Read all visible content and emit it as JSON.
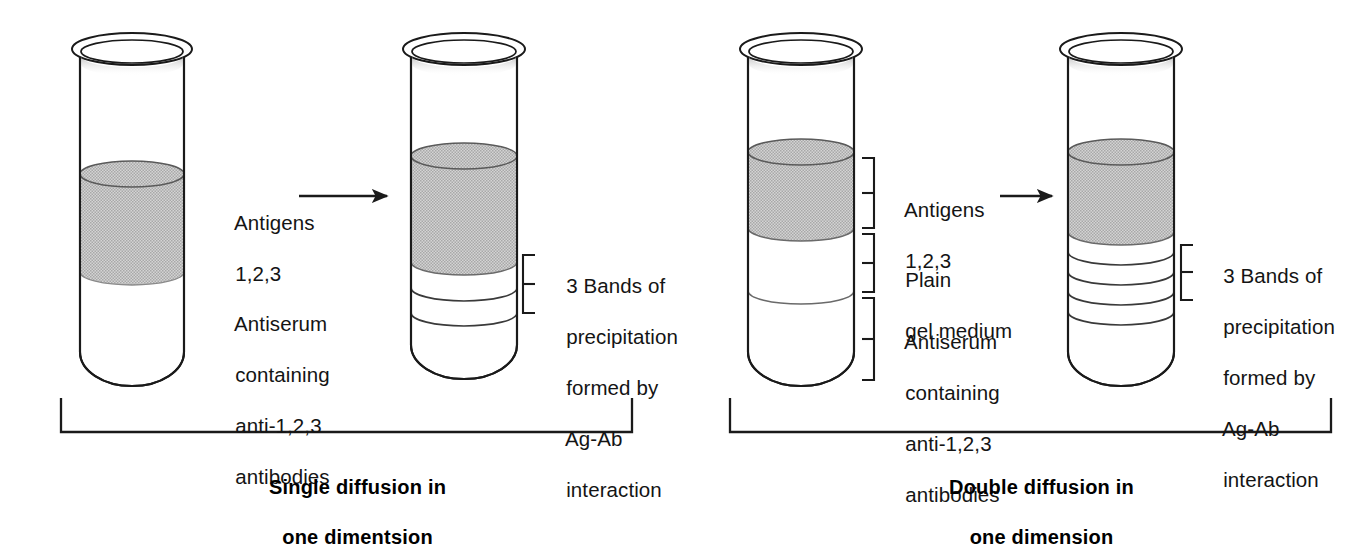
{
  "figure": {
    "title_semantic": "immunodiffusion-one-dimension-comparison",
    "background_color": "#ffffff",
    "ink_color": "#1a1a1a",
    "gel_gray": "#c2c2c2",
    "gel_gray_dark": "#b4b4b4"
  },
  "panels": [
    {
      "id": "single-diffusion",
      "caption_line1": "Single diffusion in",
      "caption_line2": "one dimentsion",
      "tubes": [
        {
          "id": "single-before",
          "role": "before-reaction",
          "layers": [
            {
              "name": "antigens",
              "fill": "gray"
            },
            {
              "name": "antiserum",
              "fill": "clear"
            }
          ],
          "bands": 0
        },
        {
          "id": "single-after",
          "role": "after-reaction",
          "layers": [
            {
              "name": "antigens",
              "fill": "gray"
            },
            {
              "name": "antiserum",
              "fill": "clear"
            }
          ],
          "bands": 3
        }
      ],
      "labels": [
        {
          "id": "antigens",
          "lines": [
            "Antigens",
            "1,2,3"
          ]
        },
        {
          "id": "antiserum",
          "lines": [
            "Antiserum",
            "containing",
            "anti-1,2,3",
            "antibodies"
          ]
        },
        {
          "id": "bands",
          "lines": [
            "3 Bands of",
            "precipitation",
            "formed by",
            "Ag-Ab",
            "interaction"
          ]
        }
      ]
    },
    {
      "id": "double-diffusion",
      "caption_line1": "Double diffusion in",
      "caption_line2": "one dimension",
      "tubes": [
        {
          "id": "double-before",
          "role": "before-reaction",
          "layers": [
            {
              "name": "antigens",
              "fill": "gray"
            },
            {
              "name": "plain-gel",
              "fill": "clear"
            },
            {
              "name": "antiserum",
              "fill": "clear"
            }
          ],
          "bands": 0
        },
        {
          "id": "double-after",
          "role": "after-reaction",
          "layers": [
            {
              "name": "antigens",
              "fill": "gray"
            },
            {
              "name": "antiserum",
              "fill": "clear"
            }
          ],
          "bands": 3
        }
      ],
      "labels": [
        {
          "id": "antigens",
          "lines": [
            "Antigens",
            "1,2,3"
          ]
        },
        {
          "id": "plain-gel",
          "lines": [
            "Plain",
            "gel medium"
          ]
        },
        {
          "id": "antiserum",
          "lines": [
            "Antiserum",
            "containing",
            "anti-1,2,3",
            "antibodies"
          ]
        },
        {
          "id": "bands",
          "lines": [
            "3 Bands of",
            "precipitation",
            "formed by",
            "Ag-Ab",
            "interaction"
          ]
        }
      ]
    }
  ],
  "text": {
    "left": {
      "antigens_l1": "Antigens",
      "antigens_l2": "1,2,3",
      "antiserum_l1": "Antiserum",
      "antiserum_l2": "containing",
      "antiserum_l3": "anti-1,2,3",
      "antiserum_l4": "antibodies",
      "bands_l1": "3 Bands of",
      "bands_l2": "precipitation",
      "bands_l3": "formed by",
      "bands_l4": "Ag-Ab",
      "bands_l5": "interaction",
      "caption_l1": "Single diffusion in",
      "caption_l2": "one dimentsion"
    },
    "right": {
      "antigens_l1": "Antigens",
      "antigens_l2": "1,2,3",
      "plain_l1": "Plain",
      "plain_l2": "gel medium",
      "antiserum_l1": "Antiserum",
      "antiserum_l2": "containing",
      "antiserum_l3": "anti-1,2,3",
      "antiserum_l4": "antibodies",
      "bands_l1": "3 Bands of",
      "bands_l2": "precipitation",
      "bands_l3": "formed by",
      "bands_l4": "Ag-Ab",
      "bands_l5": "interaction",
      "caption_l1": "Double diffusion in",
      "caption_l2": "one dimension"
    }
  },
  "icons": {
    "arrow": "rightwards-arrow-icon",
    "bracket": "curly-bracket-icon",
    "group_bracket": "group-bracket-icon",
    "test_tube": "test-tube-icon"
  }
}
